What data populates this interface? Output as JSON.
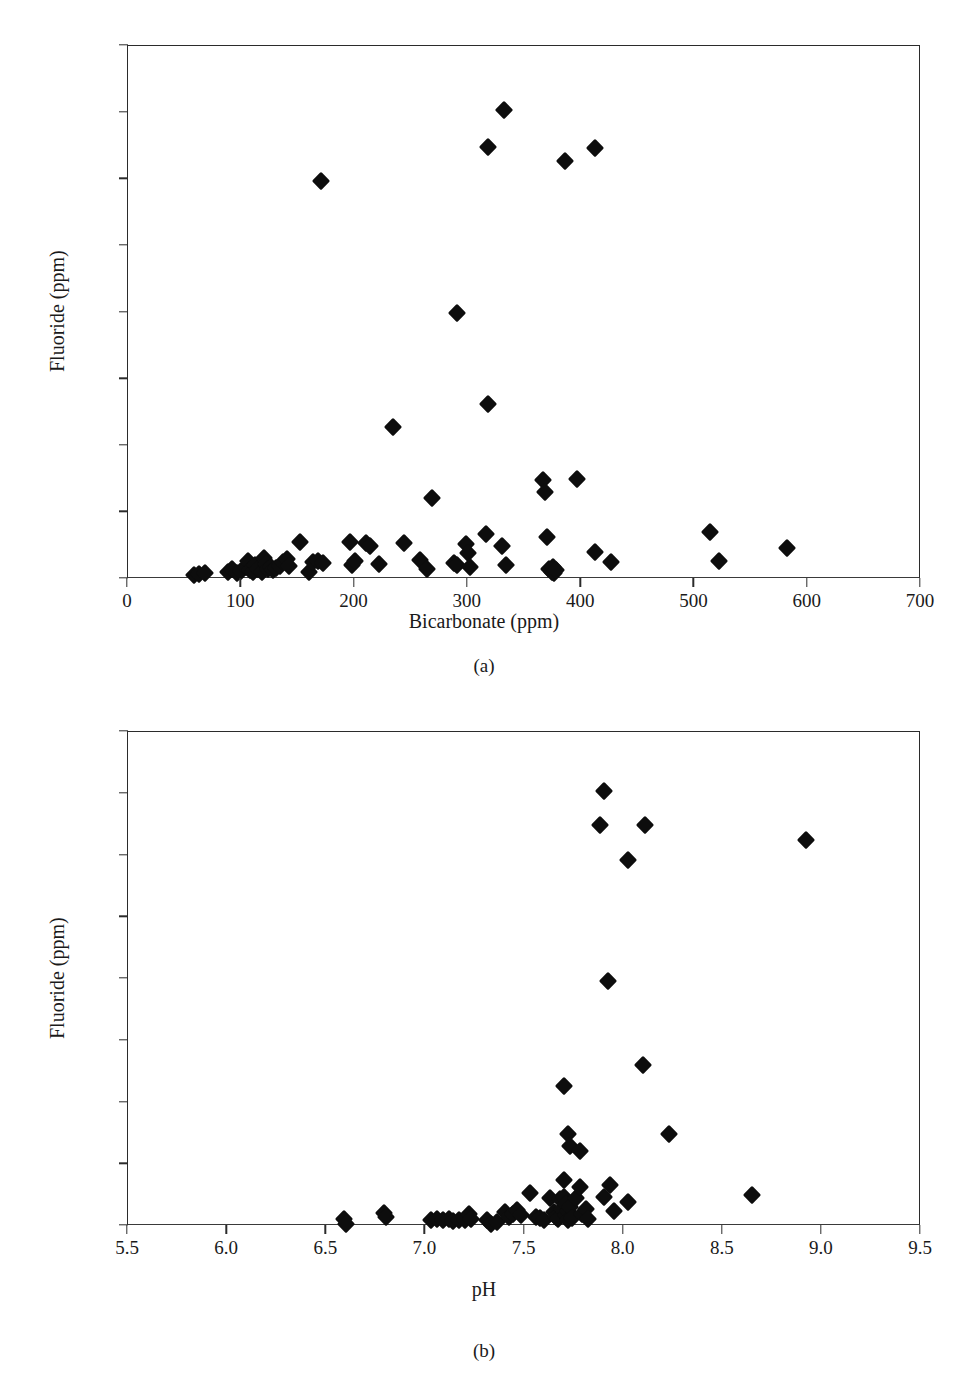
{
  "figure": {
    "panels": [
      {
        "id": "a",
        "caption": "(a)",
        "xlabel": "Bicarbonate (ppm)",
        "ylabel": "Fluoride (ppm)"
      },
      {
        "id": "b",
        "caption": "(b)",
        "xlabel": "pH",
        "ylabel": "Fluoride (ppm)"
      }
    ]
  },
  "chart_data": [
    {
      "type": "scatter",
      "panel": "a",
      "title": "",
      "xlabel": "Bicarbonate (ppm)",
      "ylabel": "Fluoride (ppm)",
      "xlim": [
        0,
        700
      ],
      "ylim": [
        0,
        16
      ],
      "xticks": [
        0,
        100,
        200,
        300,
        400,
        500,
        600,
        700
      ],
      "xtick_labels": [
        "0",
        "100",
        "200",
        "300",
        "400",
        "500",
        "600",
        "700"
      ],
      "yticks": [
        0,
        2,
        4,
        6,
        8,
        10,
        12,
        14,
        16
      ],
      "ytick_labels": [
        "0.00",
        "2.00",
        "4.00",
        "6.00",
        "8.00",
        "10.00",
        "12.00",
        "14.00",
        "16.00"
      ],
      "grid": false,
      "legend": null,
      "marker": "diamond",
      "marker_color": "#0d0d0d",
      "points": [
        [
          58,
          0.12
        ],
        [
          63,
          0.15
        ],
        [
          68,
          0.18
        ],
        [
          88,
          0.22
        ],
        [
          92,
          0.3
        ],
        [
          96,
          0.18
        ],
        [
          100,
          0.25
        ],
        [
          104,
          0.35
        ],
        [
          106,
          0.55
        ],
        [
          108,
          0.28
        ],
        [
          110,
          0.2
        ],
        [
          112,
          0.42
        ],
        [
          115,
          0.3
        ],
        [
          118,
          0.22
        ],
        [
          120,
          0.62
        ],
        [
          122,
          0.45
        ],
        [
          124,
          0.3
        ],
        [
          126,
          0.35
        ],
        [
          128,
          0.28
        ],
        [
          131,
          0.32
        ],
        [
          134,
          0.4
        ],
        [
          137,
          0.52
        ],
        [
          140,
          0.6
        ],
        [
          142,
          0.38
        ],
        [
          152,
          1.1
        ],
        [
          160,
          0.22
        ],
        [
          163,
          0.5
        ],
        [
          168,
          0.55
        ],
        [
          172,
          0.48
        ],
        [
          196,
          1.12
        ],
        [
          198,
          0.42
        ],
        [
          200,
          0.55
        ],
        [
          210,
          1.08
        ],
        [
          214,
          1.0
        ],
        [
          222,
          0.45
        ],
        [
          244,
          1.08
        ],
        [
          258,
          0.58
        ],
        [
          264,
          0.3
        ],
        [
          268,
          2.42
        ],
        [
          288,
          0.48
        ],
        [
          290,
          0.42
        ],
        [
          298,
          1.05
        ],
        [
          300,
          0.78
        ],
        [
          302,
          0.35
        ],
        [
          316,
          1.35
        ],
        [
          330,
          0.98
        ],
        [
          334,
          0.42
        ],
        [
          366,
          2.98
        ],
        [
          368,
          2.6
        ],
        [
          370,
          1.25
        ],
        [
          372,
          0.3
        ],
        [
          374,
          0.22
        ],
        [
          375,
          0.35
        ],
        [
          376,
          0.18
        ],
        [
          378,
          0.28
        ],
        [
          396,
          3.0
        ],
        [
          412,
          0.8
        ],
        [
          426,
          0.52
        ],
        [
          514,
          1.42
        ],
        [
          522,
          0.55
        ],
        [
          582,
          0.92
        ],
        [
          170,
          11.95
        ],
        [
          290,
          7.98
        ],
        [
          318,
          12.98
        ],
        [
          332,
          14.08
        ],
        [
          386,
          12.55
        ],
        [
          412,
          12.95
        ],
        [
          234,
          4.55
        ],
        [
          318,
          5.25
        ]
      ]
    },
    {
      "type": "scatter",
      "panel": "b",
      "title": "",
      "xlabel": "pH",
      "ylabel": "Fluoride (ppm)",
      "xlim": [
        5.5,
        9.5
      ],
      "ylim": [
        0,
        16
      ],
      "xticks": [
        5.5,
        6.0,
        6.5,
        7.0,
        7.5,
        8.0,
        8.5,
        9.0,
        9.5
      ],
      "xtick_labels": [
        "5.5",
        "6.0",
        "6.5",
        "7.0",
        "7.5",
        "8.0",
        "8.5",
        "9.0",
        "9.5"
      ],
      "yticks": [
        0,
        2,
        4,
        6,
        8,
        10,
        12,
        14,
        16
      ],
      "ytick_labels": [
        "0.00",
        "2.00",
        "4.00",
        "6.00",
        "8.00",
        "10.00",
        "12.00",
        "14.00",
        "16.00"
      ],
      "grid": false,
      "legend": null,
      "marker": "diamond",
      "marker_color": "#0d0d0d",
      "points": [
        [
          6.59,
          0.22
        ],
        [
          6.6,
          0.08
        ],
        [
          6.79,
          0.42
        ],
        [
          6.8,
          0.28
        ],
        [
          7.03,
          0.2
        ],
        [
          7.06,
          0.22
        ],
        [
          7.09,
          0.18
        ],
        [
          7.12,
          0.22
        ],
        [
          7.14,
          0.16
        ],
        [
          7.17,
          0.2
        ],
        [
          7.2,
          0.18
        ],
        [
          7.22,
          0.38
        ],
        [
          7.23,
          0.22
        ],
        [
          7.31,
          0.18
        ],
        [
          7.33,
          0.05
        ],
        [
          7.36,
          0.12
        ],
        [
          7.4,
          0.45
        ],
        [
          7.42,
          0.3
        ],
        [
          7.44,
          0.4
        ],
        [
          7.46,
          0.52
        ],
        [
          7.48,
          0.35
        ],
        [
          7.53,
          1.08
        ],
        [
          7.56,
          0.3
        ],
        [
          7.58,
          0.25
        ],
        [
          7.6,
          0.2
        ],
        [
          7.63,
          0.9
        ],
        [
          7.65,
          0.45
        ],
        [
          7.66,
          0.3
        ],
        [
          7.67,
          0.22
        ],
        [
          7.68,
          0.88
        ],
        [
          7.69,
          0.55
        ],
        [
          7.7,
          1.5
        ],
        [
          7.7,
          0.95
        ],
        [
          7.71,
          0.7
        ],
        [
          7.71,
          0.35
        ],
        [
          7.72,
          0.48
        ],
        [
          7.72,
          0.18
        ],
        [
          7.73,
          0.62
        ],
        [
          7.74,
          0.25
        ],
        [
          7.76,
          0.9
        ],
        [
          7.78,
          1.25
        ],
        [
          7.79,
          0.4
        ],
        [
          7.81,
          0.55
        ],
        [
          7.82,
          0.22
        ],
        [
          7.9,
          0.95
        ],
        [
          7.93,
          1.32
        ],
        [
          7.95,
          0.48
        ],
        [
          8.02,
          0.78
        ],
        [
          8.65,
          1.02
        ],
        [
          7.72,
          2.98
        ],
        [
          7.73,
          2.6
        ],
        [
          7.78,
          2.42
        ],
        [
          8.23,
          2.98
        ],
        [
          7.7,
          4.52
        ],
        [
          8.1,
          5.2
        ],
        [
          7.92,
          7.95
        ],
        [
          7.9,
          14.08
        ],
        [
          7.88,
          12.98
        ],
        [
          8.02,
          11.85
        ],
        [
          8.11,
          12.98
        ],
        [
          8.92,
          12.5
        ]
      ]
    }
  ]
}
